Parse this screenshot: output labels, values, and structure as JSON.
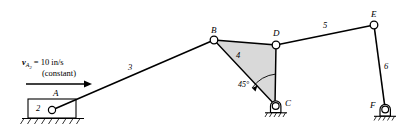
{
  "figure": {
    "type": "kinematic-linkage-diagram",
    "width": 412,
    "height": 133,
    "background_color": "#ffffff",
    "line_color": "#000000",
    "link4_fill_color": "#d9d9d9"
  },
  "velocity_annotation": {
    "symbol": "v",
    "subscript_main": "A",
    "subscript_sub": "2",
    "equals_value": "= 10 in/s",
    "qualifier": "(constant)",
    "full_text": "vA2 = 10 in/s (constant)",
    "arrow_direction": "right"
  },
  "joints": [
    {
      "id": "A",
      "label": "A",
      "x": 52,
      "y": 110,
      "type": "slider-pin"
    },
    {
      "id": "B",
      "label": "B",
      "x": 214,
      "y": 40,
      "type": "pin"
    },
    {
      "id": "C",
      "label": "C",
      "x": 275,
      "y": 106,
      "type": "grounded-pin-support"
    },
    {
      "id": "D",
      "label": "D",
      "x": 276,
      "y": 45,
      "type": "pin"
    },
    {
      "id": "E",
      "label": "E",
      "x": 374,
      "y": 25,
      "type": "pin"
    },
    {
      "id": "F",
      "label": "F",
      "x": 385,
      "y": 110,
      "type": "grounded-pin-support"
    }
  ],
  "links": [
    {
      "id": "2",
      "label": "2",
      "type": "slider-block",
      "from": "ground",
      "to": "A"
    },
    {
      "id": "3",
      "label": "3",
      "type": "binary-link",
      "from": "A",
      "to": "B"
    },
    {
      "id": "4",
      "label": "4",
      "type": "ternary-link-triangle",
      "vertices": [
        "B",
        "D",
        "C"
      ]
    },
    {
      "id": "5",
      "label": "5",
      "type": "binary-link",
      "from": "D",
      "to": "E"
    },
    {
      "id": "6",
      "label": "6",
      "type": "binary-link",
      "from": "E",
      "to": "F"
    }
  ],
  "angles": [
    {
      "label": "45°",
      "at_vertex": "interior-of-link-4",
      "value": 45,
      "unit": "degrees"
    }
  ],
  "ground_supports": [
    {
      "id": "ground-slider",
      "for": "block 2"
    },
    {
      "id": "ground-C",
      "for": "joint C"
    },
    {
      "id": "ground-F",
      "for": "joint F"
    }
  ]
}
